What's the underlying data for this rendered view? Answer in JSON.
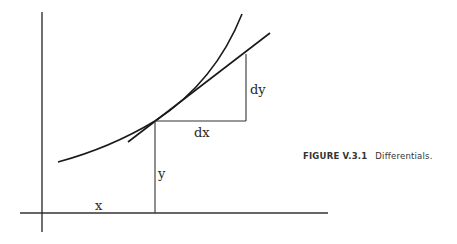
{
  "figure": {
    "caption_number": "FIGURE V.3.1",
    "caption_title": "Differentials.",
    "labels": {
      "x": "x",
      "y": "y",
      "dx": "dx",
      "dy": "dy"
    },
    "elements": {
      "x_axis": {
        "x1": 20,
        "y1": 213,
        "x2": 328,
        "y2": 213
      },
      "y_axis": {
        "x1": 42,
        "y1": 12,
        "x2": 42,
        "y2": 232
      },
      "curve": "M 58 162 Q 110 148 155 121 Q 215 82 242 14",
      "tangent_line": {
        "x1": 130,
        "y1": 140,
        "x2": 270,
        "y2": 33
      },
      "tangent_point": {
        "x": 155,
        "y": 121
      },
      "dx_segment": {
        "x1": 155,
        "y1": 121,
        "x2": 246,
        "y2": 121
      },
      "dy_segment": {
        "x1": 246,
        "y1": 121,
        "x2": 246,
        "y2": 54
      },
      "y_drop": {
        "x1": 155,
        "y1": 121,
        "x2": 155,
        "y2": 213
      }
    },
    "colors": {
      "line": "#1a1a1a",
      "text": "#2a2a2a"
    }
  }
}
